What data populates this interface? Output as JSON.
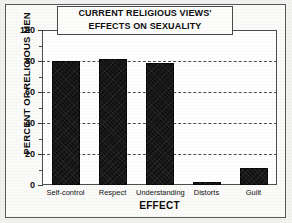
{
  "chart_data": {
    "type": "bar",
    "title": "CURRENT RELIGIOUS VIEWS' EFFECTS ON SEXUALITY",
    "title_lines": [
      "CURRENT RELIGIOUS VIEWS'",
      "EFFECTS ON SEXUALITY"
    ],
    "xlabel": "EFFECT",
    "ylabel": "PERCENT OF RELIGIOUS MEN",
    "categories": [
      "Self-control",
      "Respect",
      "Understanding",
      "Distorts",
      "Guilt"
    ],
    "values": [
      80,
      81,
      79,
      2,
      11
    ],
    "ylim": [
      0,
      100
    ],
    "ytick_labels": [
      "0",
      "20",
      "40",
      "60",
      "80",
      "100"
    ],
    "ytick_values": [
      0,
      20,
      40,
      60,
      80,
      100
    ],
    "minor_ytick_values": [
      10,
      30,
      50,
      70,
      90
    ],
    "gridline_values": [
      20,
      40,
      60,
      80
    ],
    "grid": true,
    "grid_style": "dashed",
    "legend": null,
    "bar_color": "#111111",
    "axis_color": "#4d4d4d",
    "background_color": "#ffffff",
    "page_color": "#f2f2f0"
  }
}
